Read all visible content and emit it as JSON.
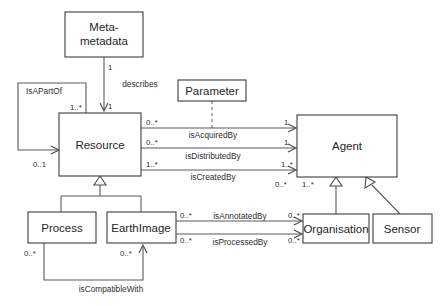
{
  "diagram": {
    "type": "uml-class-diagram",
    "background_color": "#ffffff",
    "line_color": "#5a5a5a",
    "text_color": "#2b2b2b"
  },
  "classes": [
    {
      "id": "meta-metadata",
      "name_line1": "Meta-",
      "name_line2": "metadata",
      "x": 65,
      "y": 12,
      "w": 78,
      "h": 45
    },
    {
      "id": "parameter",
      "name": "Parameter",
      "x": 178,
      "y": 80,
      "w": 68,
      "h": 21
    },
    {
      "id": "resource",
      "name": "Resource",
      "x": 59,
      "y": 113,
      "w": 82,
      "h": 63
    },
    {
      "id": "agent",
      "name": "Agent",
      "x": 297,
      "y": 115,
      "w": 100,
      "h": 62
    },
    {
      "id": "process",
      "name": "Process",
      "x": 28,
      "y": 212,
      "w": 68,
      "h": 31
    },
    {
      "id": "earthimage",
      "name": "EarthImage",
      "x": 107,
      "y": 212,
      "w": 69,
      "h": 31
    },
    {
      "id": "organisation",
      "name": "Organisation",
      "x": 303,
      "y": 214,
      "w": 66,
      "h": 29
    },
    {
      "id": "sensor",
      "name": "Sensor",
      "x": 373,
      "y": 214,
      "w": 59,
      "h": 29
    }
  ],
  "associations": [
    {
      "id": "describes",
      "label": "describes",
      "from": "meta-metadata",
      "to": "resource",
      "source_multiplicity": "1",
      "target_multiplicity": "1"
    },
    {
      "id": "isapartof",
      "label": "IsAPartOf",
      "from": "resource",
      "to": "resource",
      "source_multiplicity": "1..*",
      "target_multiplicity": "0..1"
    },
    {
      "id": "isacquiredby",
      "label": "isAcquiredBy",
      "from": "resource",
      "to": "agent",
      "source_multiplicity": "0..*",
      "target_multiplicity": "1"
    },
    {
      "id": "isdistributedby",
      "label": "isDistributedBy",
      "from": "resource",
      "to": "agent",
      "source_multiplicity": "0..*",
      "target_multiplicity": "1"
    },
    {
      "id": "iscreatedby",
      "label": "isCreatedBy",
      "from": "resource",
      "to": "agent",
      "source_multiplicity": "1..*",
      "target_multiplicity": "1..*"
    },
    {
      "id": "isannotatedby",
      "label": "isAnnotatedBy",
      "from": "earthimage",
      "to": "organisation",
      "source_multiplicity": "0..*",
      "target_multiplicity": "0..*"
    },
    {
      "id": "isprocessedby",
      "label": "isProcessedBy",
      "from": "earthimage",
      "to": "organisation",
      "source_multiplicity": "0..*",
      "target_multiplicity": "0..*"
    },
    {
      "id": "iscompatiblewith",
      "label": "isCompatibleWith",
      "from": "process",
      "to": "earthimage",
      "source_multiplicity": "0..*",
      "target_multiplicity": "0..*"
    }
  ],
  "agent_bottom_multiplicities": {
    "left": "0..*",
    "right": "1..*"
  },
  "generalizations": [
    {
      "id": "process-to-resource",
      "child": "process",
      "parent": "resource"
    },
    {
      "id": "earthimage-to-resource",
      "child": "earthimage",
      "parent": "resource"
    },
    {
      "id": "organisation-to-agent",
      "child": "organisation",
      "parent": "agent"
    },
    {
      "id": "sensor-to-agent",
      "child": "sensor",
      "parent": "agent"
    }
  ],
  "dependencies": [
    {
      "id": "parameter-to-resource-agent",
      "from": "parameter",
      "style": "dashed"
    }
  ]
}
